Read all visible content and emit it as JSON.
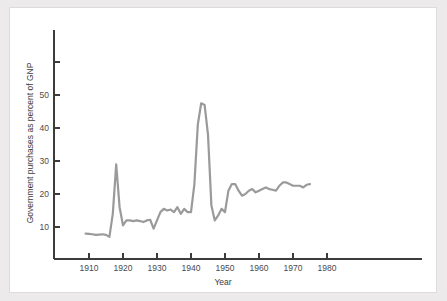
{
  "chart_data": {
    "type": "line",
    "title": "",
    "xlabel": "Year",
    "ylabel": "Government purchases as percent of GNP",
    "xlim": [
      1903,
      1988
    ],
    "ylim": [
      0,
      62
    ],
    "grid": false,
    "legend": false,
    "legend_position": "none",
    "line_color": "#9a9a9a",
    "axis_color": "#3c3c3c",
    "background_color": "#ffffff",
    "page_background_color": "#eceaea",
    "xticks": [
      1910,
      1920,
      1930,
      1940,
      1950,
      1960,
      1970,
      1980
    ],
    "xtick_labels": [
      "1910",
      "1920",
      "1930",
      "1940",
      "1950",
      "1960",
      "1970",
      "1980"
    ],
    "yticks": [
      10,
      20,
      30,
      40,
      50,
      60
    ],
    "ytick_labels": [
      "10",
      "20",
      "30",
      "40",
      "50",
      ""
    ],
    "series": [
      {
        "name": "Government purchases as percent of GNP",
        "x": [
          1909,
          1910,
          1911,
          1912,
          1913,
          1914,
          1915,
          1916,
          1917,
          1918,
          1919,
          1920,
          1921,
          1922,
          1923,
          1924,
          1925,
          1926,
          1927,
          1928,
          1929,
          1930,
          1931,
          1932,
          1933,
          1934,
          1935,
          1936,
          1937,
          1938,
          1939,
          1940,
          1941,
          1942,
          1943,
          1944,
          1945,
          1946,
          1947,
          1948,
          1949,
          1950,
          1951,
          1952,
          1953,
          1954,
          1955,
          1956,
          1957,
          1958,
          1959,
          1960,
          1961,
          1962,
          1963,
          1964,
          1965,
          1966,
          1967,
          1968,
          1969,
          1970,
          1971,
          1972,
          1973,
          1974,
          1975
        ],
        "values": [
          8.0,
          7.9,
          7.8,
          7.6,
          7.7,
          7.8,
          7.6,
          7.0,
          14.0,
          29.0,
          16.0,
          10.5,
          12.0,
          12.0,
          11.8,
          12.0,
          11.8,
          11.5,
          12.0,
          12.2,
          9.5,
          12.0,
          14.5,
          15.5,
          15.0,
          15.3,
          14.5,
          16.0,
          14.0,
          15.5,
          14.5,
          14.5,
          23.0,
          41.0,
          47.5,
          47.0,
          38.0,
          16.5,
          12.0,
          13.5,
          15.5,
          14.5,
          21.0,
          23.0,
          23.0,
          21.0,
          19.5,
          20.0,
          21.0,
          21.5,
          20.5,
          21.0,
          21.5,
          22.0,
          21.5,
          21.3,
          21.0,
          22.5,
          23.5,
          23.5,
          23.0,
          22.5,
          22.5,
          22.5,
          22.0,
          22.8,
          23.0
        ]
      }
    ]
  },
  "axis_labels": {
    "x_title": "Year",
    "y_title": "Government purchases as percent of GNP"
  }
}
